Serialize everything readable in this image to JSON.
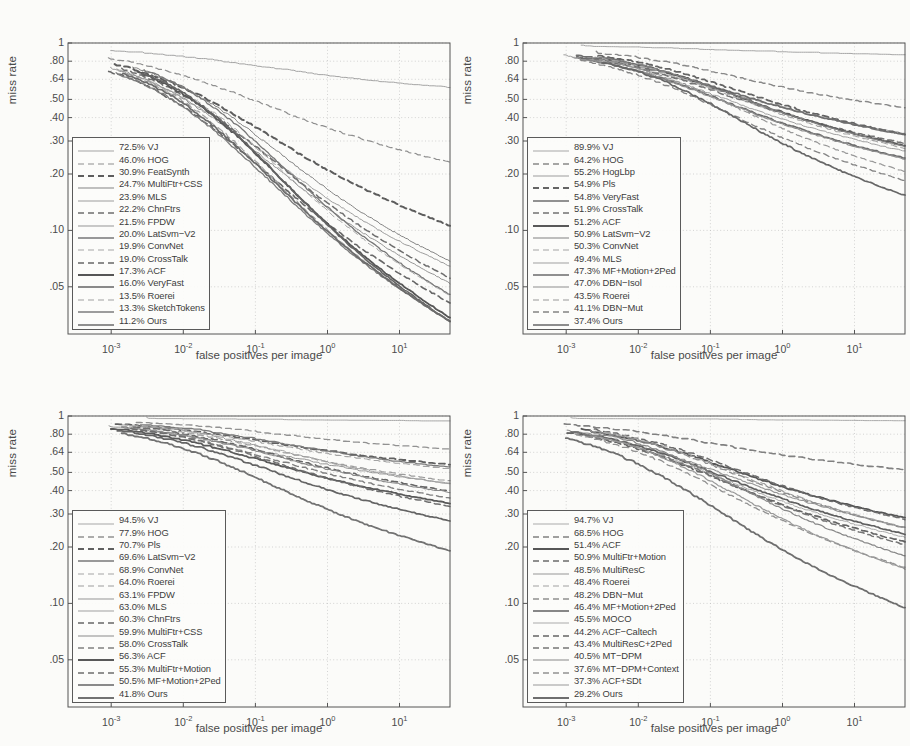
{
  "figure": {
    "type": "multi-panel-line-plot",
    "panels": 4,
    "background": "#fbfbf9",
    "ink": "#444444"
  },
  "axes": {
    "xlabel": "false positives per image",
    "ylabel": "miss rate",
    "yticks": [
      "1",
      ".80",
      ".64",
      ".50",
      ".40",
      ".30",
      ".20",
      ".10",
      ".05"
    ],
    "ytick_values": [
      1,
      0.8,
      0.64,
      0.5,
      0.4,
      0.3,
      0.2,
      0.1,
      0.05
    ],
    "xticks": [
      "-3",
      "-2",
      "-1",
      "0",
      "1"
    ],
    "xtick_base": "10",
    "xlim": [
      -3.6,
      1.7
    ],
    "ylim": [
      0.028,
      1.0
    ],
    "grid": true
  },
  "chart_data": [
    {
      "type": "line",
      "title": "",
      "xlabel": "false positives per image",
      "ylabel": "miss rate",
      "xscale": "log",
      "yscale": "log-miss-rate",
      "xlim": [
        -3.6,
        1.7
      ],
      "ylim": [
        0.028,
        1.0
      ],
      "grid": true,
      "legend_position": "lower-left",
      "series": [
        {
          "name": "VJ",
          "label": "72.5% VJ",
          "mr": 72.5,
          "style": "solid",
          "shade": 0.7,
          "width": 1.0
        },
        {
          "name": "HOG",
          "label": "46.0% HOG",
          "mr": 46.0,
          "style": "dashed",
          "shade": 0.58,
          "width": 1.2
        },
        {
          "name": "FeatSynth",
          "label": "30.9% FeatSynth",
          "mr": 30.9,
          "style": "dashed",
          "shade": 0.3,
          "width": 2.0
        },
        {
          "name": "MultiFtr+CSS",
          "label": "24.7% MultiFtr+CSS",
          "mr": 24.7,
          "style": "solid",
          "shade": 0.52,
          "width": 1.0
        },
        {
          "name": "MLS",
          "label": "23.9% MLS",
          "mr": 23.9,
          "style": "solid",
          "shade": 0.66,
          "width": 1.0
        },
        {
          "name": "ChnFtrs",
          "label": "22.2% ChnFtrs",
          "mr": 22.2,
          "style": "dashed",
          "shade": 0.4,
          "width": 1.5
        },
        {
          "name": "FPDW",
          "label": "21.5% FPDW",
          "mr": 21.5,
          "style": "solid",
          "shade": 0.62,
          "width": 1.0
        },
        {
          "name": "LatSvm-V2",
          "label": "20.0% LatSvm−V2",
          "mr": 20.0,
          "style": "solid",
          "shade": 0.45,
          "width": 1.3
        },
        {
          "name": "ConvNet",
          "label": "19.9% ConvNet",
          "mr": 19.9,
          "style": "dashed",
          "shade": 0.72,
          "width": 1.0
        },
        {
          "name": "CrossTalk",
          "label": "19.0% CrossTalk",
          "mr": 19.0,
          "style": "dashed",
          "shade": 0.36,
          "width": 1.6
        },
        {
          "name": "ACF",
          "label": "17.3% ACF",
          "mr": 17.3,
          "style": "solid",
          "shade": 0.26,
          "width": 1.8
        },
        {
          "name": "VeryFast",
          "label": "16.0% VeryFast",
          "mr": 16.0,
          "style": "solid",
          "shade": 0.34,
          "width": 1.6
        },
        {
          "name": "Roerei",
          "label": "13.5% Roerei",
          "mr": 13.5,
          "style": "dashed",
          "shade": 0.68,
          "width": 1.2
        },
        {
          "name": "SketchTokens",
          "label": "13.3% SketchTokens",
          "mr": 13.3,
          "style": "solid",
          "shade": 0.48,
          "width": 1.3
        },
        {
          "name": "Ours",
          "label": "11.2% Ours",
          "mr": 11.2,
          "style": "solid",
          "shade": 0.38,
          "width": 1.7
        }
      ]
    },
    {
      "type": "line",
      "title": "",
      "xlabel": "false positives per image",
      "ylabel": "miss rate",
      "xscale": "log",
      "yscale": "log-miss-rate",
      "xlim": [
        -3.6,
        1.7
      ],
      "ylim": [
        0.028,
        1.0
      ],
      "grid": true,
      "legend_position": "lower-left",
      "series": [
        {
          "name": "VJ",
          "label": "89.9% VJ",
          "mr": 89.9,
          "style": "solid",
          "shade": 0.72,
          "width": 1.0
        },
        {
          "name": "HOG",
          "label": "64.2% HOG",
          "mr": 64.2,
          "style": "dashed",
          "shade": 0.55,
          "width": 1.4
        },
        {
          "name": "HogLbp",
          "label": "55.2% HogLbp",
          "mr": 55.2,
          "style": "solid",
          "shade": 0.66,
          "width": 1.0
        },
        {
          "name": "Pls",
          "label": "54.9% Pls",
          "mr": 54.9,
          "style": "dashed",
          "shade": 0.34,
          "width": 1.8
        },
        {
          "name": "VeryFast",
          "label": "54.8% VeryFast",
          "mr": 54.8,
          "style": "solid",
          "shade": 0.4,
          "width": 1.7
        },
        {
          "name": "CrossTalk",
          "label": "51.9% CrossTalk",
          "mr": 51.9,
          "style": "dashed",
          "shade": 0.42,
          "width": 1.5
        },
        {
          "name": "ACF",
          "label": "51.2% ACF",
          "mr": 51.2,
          "style": "solid",
          "shade": 0.28,
          "width": 1.8
        },
        {
          "name": "LatSvm-V2",
          "label": "50.9% LatSvm−V2",
          "mr": 50.9,
          "style": "solid",
          "shade": 0.5,
          "width": 1.2
        },
        {
          "name": "ConvNet",
          "label": "50.3% ConvNet",
          "mr": 50.3,
          "style": "dashed",
          "shade": 0.7,
          "width": 1.1
        },
        {
          "name": "MLS",
          "label": "49.4% MLS",
          "mr": 49.4,
          "style": "solid",
          "shade": 0.68,
          "width": 1.0
        },
        {
          "name": "MF+Motion+2Ped",
          "label": "47.3% MF+Motion+2Ped",
          "mr": 47.3,
          "style": "solid",
          "shade": 0.38,
          "width": 1.6
        },
        {
          "name": "DBN-Isol",
          "label": "47.0% DBN−Isol",
          "mr": 47.0,
          "style": "solid",
          "shade": 0.58,
          "width": 1.2
        },
        {
          "name": "Roerei",
          "label": "43.5% Roerei",
          "mr": 43.5,
          "style": "dashed",
          "shade": 0.64,
          "width": 1.2
        },
        {
          "name": "DBN-Mut",
          "label": "41.1% DBN−Mut",
          "mr": 41.1,
          "style": "dashed",
          "shade": 0.52,
          "width": 1.3
        },
        {
          "name": "Ours",
          "label": "37.4% Ours",
          "mr": 37.4,
          "style": "solid",
          "shade": 0.36,
          "width": 1.7
        }
      ]
    },
    {
      "type": "line",
      "title": "",
      "xlabel": "false positives per image",
      "ylabel": "miss rate",
      "xscale": "log",
      "yscale": "log-miss-rate",
      "xlim": [
        -3.6,
        1.7
      ],
      "ylim": [
        0.028,
        1.0
      ],
      "grid": true,
      "legend_position": "lower-left",
      "series": [
        {
          "name": "VJ",
          "label": "94.5% VJ",
          "mr": 94.5,
          "style": "solid",
          "shade": 0.72,
          "width": 1.0
        },
        {
          "name": "HOG",
          "label": "77.9% HOG",
          "mr": 77.9,
          "style": "dashed",
          "shade": 0.6,
          "width": 1.3
        },
        {
          "name": "Pls",
          "label": "70.7% Pls",
          "mr": 70.7,
          "style": "dashed",
          "shade": 0.32,
          "width": 1.8
        },
        {
          "name": "LatSvm-V2",
          "label": "69.6% LatSvm−V2",
          "mr": 69.6,
          "style": "solid",
          "shade": 0.46,
          "width": 1.3
        },
        {
          "name": "ConvNet",
          "label": "68.9% ConvNet",
          "mr": 68.9,
          "style": "dashed",
          "shade": 0.7,
          "width": 1.1
        },
        {
          "name": "Roerei",
          "label": "64.0% Roerei",
          "mr": 64.0,
          "style": "dashed",
          "shade": 0.66,
          "width": 1.2
        },
        {
          "name": "FPDW",
          "label": "63.1% FPDW",
          "mr": 63.1,
          "style": "solid",
          "shade": 0.62,
          "width": 1.0
        },
        {
          "name": "MLS",
          "label": "63.0% MLS",
          "mr": 63.0,
          "style": "solid",
          "shade": 0.68,
          "width": 1.0
        },
        {
          "name": "ChnFtrs",
          "label": "60.3% ChnFtrs",
          "mr": 60.3,
          "style": "dashed",
          "shade": 0.36,
          "width": 1.6
        },
        {
          "name": "MultiFtr+CSS",
          "label": "59.9% MultiFtr+CSS",
          "mr": 59.9,
          "style": "solid",
          "shade": 0.56,
          "width": 1.1
        },
        {
          "name": "CrossTalk",
          "label": "58.0% CrossTalk",
          "mr": 58.0,
          "style": "dashed",
          "shade": 0.5,
          "width": 1.4
        },
        {
          "name": "ACF",
          "label": "56.3% ACF",
          "mr": 56.3,
          "style": "solid",
          "shade": 0.28,
          "width": 1.8
        },
        {
          "name": "MultiFtr+Motion",
          "label": "55.3% MultiFtr+Motion",
          "mr": 55.3,
          "style": "dashed",
          "shade": 0.4,
          "width": 1.5
        },
        {
          "name": "MF+Motion+2Ped",
          "label": "50.5% MF+Motion+2Ped",
          "mr": 50.5,
          "style": "solid",
          "shade": 0.34,
          "width": 1.7
        },
        {
          "name": "Ours",
          "label": "41.8% Ours",
          "mr": 41.8,
          "style": "solid",
          "shade": 0.42,
          "width": 1.8
        }
      ]
    },
    {
      "type": "line",
      "title": "",
      "xlabel": "false positives per image",
      "ylabel": "miss rate",
      "xscale": "log",
      "yscale": "log-miss-rate",
      "xlim": [
        -3.6,
        1.7
      ],
      "ylim": [
        0.028,
        1.0
      ],
      "grid": true,
      "legend_position": "lower-left",
      "series": [
        {
          "name": "VJ",
          "label": "94.7% VJ",
          "mr": 94.7,
          "style": "solid",
          "shade": 0.74,
          "width": 1.0
        },
        {
          "name": "HOG",
          "label": "68.5% HOG",
          "mr": 68.5,
          "style": "dashed",
          "shade": 0.5,
          "width": 1.6
        },
        {
          "name": "ACF",
          "label": "51.4% ACF",
          "mr": 51.4,
          "style": "solid",
          "shade": 0.26,
          "width": 1.8
        },
        {
          "name": "MultiFtr+Motion",
          "label": "50.9% MultiFtr+Motion",
          "mr": 50.9,
          "style": "dashed",
          "shade": 0.38,
          "width": 1.5
        },
        {
          "name": "MultiResC",
          "label": "48.5% MultiResC",
          "mr": 48.5,
          "style": "solid",
          "shade": 0.62,
          "width": 1.1
        },
        {
          "name": "Roerei",
          "label": "48.4% Roerei",
          "mr": 48.4,
          "style": "dashed",
          "shade": 0.68,
          "width": 1.2
        },
        {
          "name": "DBN-Mut",
          "label": "48.2% DBN−Mut",
          "mr": 48.2,
          "style": "dashed",
          "shade": 0.58,
          "width": 1.3
        },
        {
          "name": "MF+Motion+2Ped",
          "label": "46.4% MF+Motion+2Ped",
          "mr": 46.4,
          "style": "solid",
          "shade": 0.32,
          "width": 1.7
        },
        {
          "name": "MOCO",
          "label": "45.5% MOCO",
          "mr": 45.5,
          "style": "solid",
          "shade": 0.74,
          "width": 1.0
        },
        {
          "name": "ACF-Caltech",
          "label": "44.2% ACF−Caltech",
          "mr": 44.2,
          "style": "dashed",
          "shade": 0.34,
          "width": 1.7
        },
        {
          "name": "MultiResC+2Ped",
          "label": "43.4% MultiResC+2Ped",
          "mr": 43.4,
          "style": "dashed",
          "shade": 0.44,
          "width": 1.5
        },
        {
          "name": "MT-DPM",
          "label": "40.5% MT−DPM",
          "mr": 40.5,
          "style": "solid",
          "shade": 0.54,
          "width": 1.2
        },
        {
          "name": "MT-DPM+Context",
          "label": "37.6% MT−DPM+Context",
          "mr": 37.6,
          "style": "dashed",
          "shade": 0.6,
          "width": 1.3
        },
        {
          "name": "ACF+SDt",
          "label": "37.3% ACF+SDt",
          "mr": 37.3,
          "style": "solid",
          "shade": 0.64,
          "width": 1.2
        },
        {
          "name": "Ours",
          "label": "29.2% Ours",
          "mr": 29.2,
          "style": "solid",
          "shade": 0.4,
          "width": 1.8
        }
      ]
    }
  ]
}
